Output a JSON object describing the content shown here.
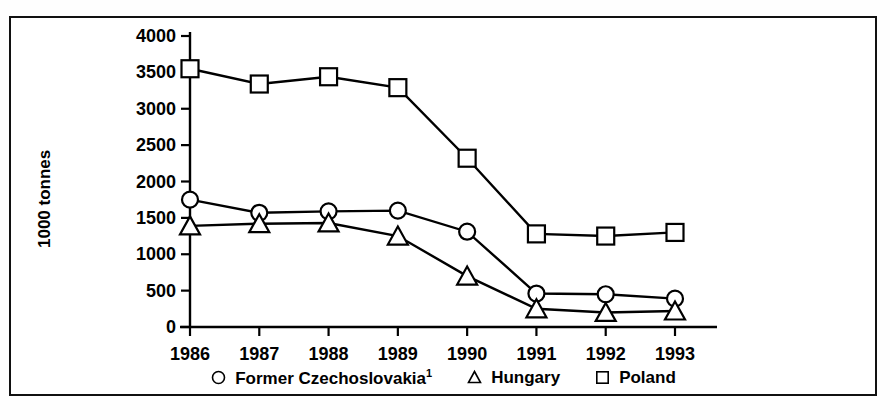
{
  "chart_data": {
    "type": "line",
    "title": "",
    "subtitle": "",
    "xlabel": "",
    "ylabel": "1000 tonnes",
    "categories": [
      "1986",
      "1987",
      "1988",
      "1989",
      "1990",
      "1991",
      "1992",
      "1993"
    ],
    "x": [
      1986,
      1987,
      1988,
      1989,
      1990,
      1991,
      1992,
      1993
    ],
    "ylim": [
      0,
      4000
    ],
    "xlim": [
      1986,
      1993
    ],
    "y_ticks": [
      0,
      500,
      1000,
      1500,
      2000,
      2500,
      3000,
      3500,
      4000
    ],
    "y_tick_labels": [
      "0",
      "500",
      "1000",
      "1500",
      "2000",
      "2500",
      "3000",
      "3500",
      "4000"
    ],
    "x_tick_labels": [
      "1986",
      "1987",
      "1988",
      "1989",
      "1990",
      "1991",
      "1992",
      "1993"
    ],
    "grid": false,
    "legend_position": "bottom",
    "series": [
      {
        "name": "Former Czechoslovakia",
        "footnote": "1",
        "marker": "circle",
        "color": "#000000",
        "values": [
          1750,
          1570,
          1590,
          1600,
          1310,
          460,
          450,
          390
        ]
      },
      {
        "name": "Hungary",
        "footnote": "",
        "marker": "triangle",
        "color": "#000000",
        "values": [
          1390,
          1420,
          1430,
          1250,
          700,
          250,
          200,
          220
        ]
      },
      {
        "name": "Poland",
        "footnote": "",
        "marker": "square",
        "color": "#000000",
        "values": [
          3550,
          3340,
          3440,
          3290,
          2320,
          1280,
          1250,
          1300
        ]
      }
    ],
    "annotations": []
  },
  "axis": {
    "y_title": "1000 tonnes"
  },
  "legend": {
    "items": [
      {
        "label": "Former Czechoslovakia",
        "footnote": "1",
        "marker": "circle-marker"
      },
      {
        "label": "Hungary",
        "footnote": "",
        "marker": "triangle-marker"
      },
      {
        "label": "Poland",
        "footnote": "",
        "marker": "square-marker"
      }
    ]
  }
}
